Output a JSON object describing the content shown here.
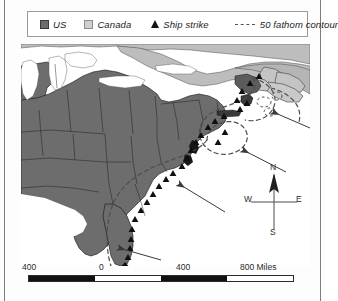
{
  "figure": {
    "type": "thematic-map",
    "region": "Eastern North America and Northwest Atlantic Ocean"
  },
  "legend": {
    "items": [
      {
        "key": "us",
        "label": "US",
        "symbol": "filled-square",
        "color": "#6d6d6d"
      },
      {
        "key": "canada",
        "label": "Canada",
        "symbol": "filled-square",
        "color": "#cfcfcf"
      },
      {
        "key": "strike",
        "label": "Ship strike",
        "symbol": "filled-triangle",
        "color": "#141414"
      },
      {
        "key": "contour",
        "label": "50 fathom contour",
        "symbol": "dashed-line",
        "color": "#555555"
      }
    ]
  },
  "compass": {
    "north": "N",
    "south": "S",
    "east": "E",
    "west": "W"
  },
  "scale": {
    "labels": [
      "400",
      "0",
      "400",
      "800 Miles"
    ],
    "unit": "Miles",
    "segment_values": [
      400,
      0,
      400,
      800
    ]
  },
  "caption": {
    "text": ""
  },
  "map_data": {
    "land_fill_us": "#6d6d6d",
    "land_fill_canada": "#bdbdbd",
    "water_fill": "#ffffff",
    "border_color": "#1a1a1a",
    "contour_color": "#555555",
    "arrow_color": "#3a3a3a",
    "ship_strike_count_visible": 28,
    "current_arrows": 4,
    "arrow_direction": "northwest (toward coast)"
  }
}
